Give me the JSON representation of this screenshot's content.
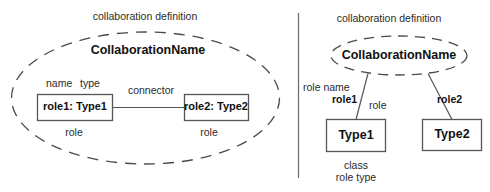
{
  "figure": {
    "kind": "uml-collaboration-diagram",
    "stroke_color": "#4a4a4a",
    "box_stroke_color": "#555555",
    "text_color": "#1a1a1a",
    "background": "#ffffff"
  },
  "left_panel": {
    "title": "collaboration definition",
    "ellipse_label": "CollaborationName",
    "annotations": {
      "name": "name",
      "type": "type",
      "connector": "connector",
      "role_left": "role",
      "role_right": "role"
    },
    "boxes": [
      {
        "label": "role1: Type1"
      },
      {
        "label": "role2: Type2"
      }
    ]
  },
  "right_panel": {
    "title": "collaboration definition",
    "ellipse_label": "CollaborationName",
    "annotations": {
      "role_name": "role name",
      "role": "role",
      "class": "class",
      "role_type": "role type"
    },
    "edges": [
      {
        "label": "role1"
      },
      {
        "label": "role2"
      }
    ],
    "boxes": [
      {
        "label": "Type1"
      },
      {
        "label": "Type2"
      }
    ]
  }
}
